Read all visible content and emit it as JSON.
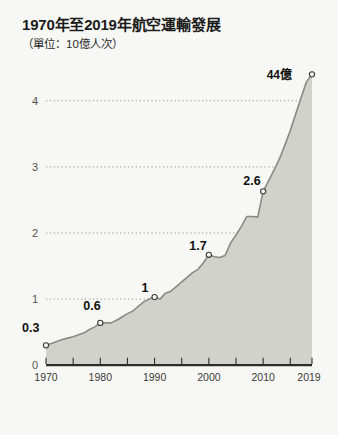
{
  "chart_data": {
    "type": "area",
    "title": "1970年至2019年航空運輸發展",
    "subtitle": "（單位：10億人次）",
    "xlabel": "",
    "ylabel": "",
    "xlim": [
      1970,
      2019
    ],
    "ylim": [
      0,
      4.4
    ],
    "grid": "horizontal-dotted",
    "legend": "none",
    "accent_fill": "#d0d0ca",
    "line_color": "#7d7d76",
    "background": "#f7f7f5",
    "y_ticks": [
      "0",
      "1",
      "2",
      "3",
      "4"
    ],
    "y_tick_values": [
      0,
      1,
      2,
      3,
      4
    ],
    "x_ticks": [
      "1970",
      "1980",
      "1990",
      "2000",
      "2010",
      "2019"
    ],
    "x_tick_values": [
      1970,
      1980,
      1990,
      2000,
      2010,
      2019
    ],
    "x_minor_tick_values": [
      1970,
      1975,
      1980,
      1985,
      1990,
      1995,
      2000,
      2005,
      2010,
      2015,
      2019
    ],
    "annotations": [
      {
        "label": "0.3",
        "x": 1970,
        "y": 0.3
      },
      {
        "label": "0.6",
        "x": 1980,
        "y": 0.64
      },
      {
        "label": "1",
        "x": 1990,
        "y": 1.03
      },
      {
        "label": "1.7",
        "x": 2000,
        "y": 1.67
      },
      {
        "label": "2.6",
        "x": 2010,
        "y": 2.63
      },
      {
        "label": "44億",
        "x": 2019,
        "y": 4.4
      }
    ],
    "x": [
      1970,
      1971,
      1972,
      1973,
      1974,
      1975,
      1976,
      1977,
      1978,
      1979,
      1980,
      1981,
      1982,
      1983,
      1984,
      1985,
      1986,
      1987,
      1988,
      1989,
      1990,
      1991,
      1992,
      1993,
      1994,
      1995,
      1996,
      1997,
      1998,
      1999,
      2000,
      2001,
      2002,
      2003,
      2004,
      2005,
      2006,
      2007,
      2008,
      2009,
      2010,
      2011,
      2012,
      2013,
      2014,
      2015,
      2016,
      2017,
      2018,
      2019
    ],
    "values": [
      0.3,
      0.33,
      0.36,
      0.39,
      0.41,
      0.43,
      0.46,
      0.49,
      0.54,
      0.58,
      0.64,
      0.64,
      0.64,
      0.68,
      0.73,
      0.78,
      0.82,
      0.89,
      0.96,
      1.0,
      1.03,
      1.0,
      1.09,
      1.12,
      1.19,
      1.26,
      1.33,
      1.4,
      1.45,
      1.55,
      1.67,
      1.64,
      1.63,
      1.66,
      1.85,
      1.97,
      2.1,
      2.25,
      2.25,
      2.24,
      2.63,
      2.79,
      2.95,
      3.12,
      3.33,
      3.55,
      3.8,
      4.05,
      4.29,
      4.4
    ],
    "series": [
      {
        "name": "全球航空旅客人次",
        "values": [
          0.3,
          0.33,
          0.36,
          0.39,
          0.41,
          0.43,
          0.46,
          0.49,
          0.54,
          0.58,
          0.64,
          0.64,
          0.64,
          0.68,
          0.73,
          0.78,
          0.82,
          0.89,
          0.96,
          1.0,
          1.03,
          1.0,
          1.09,
          1.12,
          1.19,
          1.26,
          1.33,
          1.4,
          1.45,
          1.55,
          1.67,
          1.64,
          1.63,
          1.66,
          1.85,
          1.97,
          2.1,
          2.25,
          2.25,
          2.24,
          2.63,
          2.79,
          2.95,
          3.12,
          3.33,
          3.55,
          3.8,
          4.05,
          4.29,
          4.4
        ]
      }
    ]
  }
}
